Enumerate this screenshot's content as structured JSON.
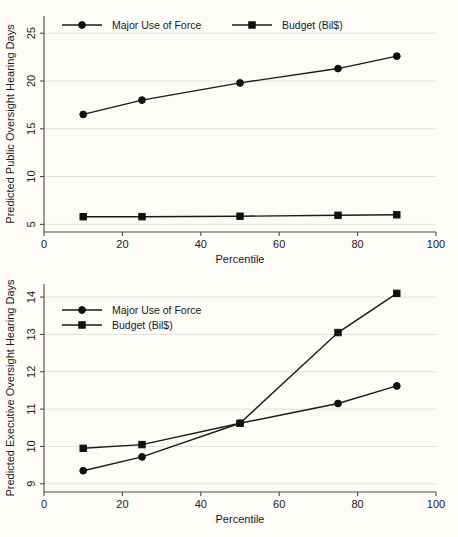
{
  "chart_data": [
    {
      "id": "public-oversight",
      "type": "line",
      "title": "",
      "xlabel": "Percentile",
      "ylabel": "Predicted Public Oversight Hearing Days",
      "x": [
        10,
        25,
        50,
        75,
        90
      ],
      "xlim": [
        0,
        100
      ],
      "ylim": [
        4.2,
        26.8
      ],
      "xticks": [
        0,
        20,
        40,
        60,
        80,
        100
      ],
      "xtick_labels": [
        "0",
        "20",
        "40",
        "60",
        "80",
        "100"
      ],
      "yticks": [
        5,
        10,
        15,
        20,
        25
      ],
      "ytick_labels": [
        "5",
        "10",
        "15",
        "20",
        "25"
      ],
      "grid": true,
      "legend_position": "top-inside-horizontal",
      "series": [
        {
          "name": "Major Use of Force",
          "marker": "circle",
          "values": [
            16.5,
            18.0,
            19.8,
            21.3,
            22.6
          ]
        },
        {
          "name": "Budget (Bil$)",
          "marker": "square",
          "values": [
            5.8,
            5.8,
            5.85,
            5.95,
            6.0
          ]
        }
      ]
    },
    {
      "id": "executive-oversight",
      "type": "line",
      "title": "",
      "xlabel": "Percentile",
      "ylabel": "Predicted Executive Oversight Hearing Days",
      "x": [
        10,
        25,
        50,
        75,
        90
      ],
      "xlim": [
        0,
        100
      ],
      "ylim": [
        8.78,
        14.35
      ],
      "xticks": [
        0,
        20,
        40,
        60,
        80,
        100
      ],
      "xtick_labels": [
        "0",
        "20",
        "40",
        "60",
        "80",
        "100"
      ],
      "yticks": [
        9,
        10,
        11,
        12,
        13,
        14
      ],
      "ytick_labels": [
        "9",
        "10",
        "11",
        "12",
        "13",
        "14"
      ],
      "grid": true,
      "legend_position": "upper-left-inside-stacked",
      "series": [
        {
          "name": "Major Use of Force",
          "marker": "circle",
          "values": [
            9.35,
            9.72,
            10.62,
            11.15,
            11.62
          ]
        },
        {
          "name": "Budget (Bil$)",
          "marker": "square",
          "values": [
            9.95,
            10.05,
            10.62,
            13.05,
            14.1
          ]
        }
      ]
    }
  ],
  "colors": {
    "background": "#fdfcf7",
    "line": "#1a1a1a",
    "grid": "#e3e1da",
    "axis": "#4a4a4a"
  }
}
